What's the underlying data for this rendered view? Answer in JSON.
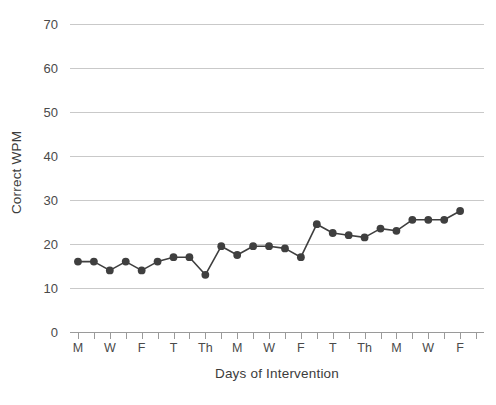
{
  "chart_data": {
    "type": "line",
    "title": "",
    "xlabel": "Days of Intervention",
    "ylabel": "Correct WPM",
    "ylim": [
      0,
      70
    ],
    "ytick_values": [
      0,
      10,
      20,
      30,
      40,
      50,
      60,
      70
    ],
    "ytick_labels": [
      "0",
      "10",
      "20",
      "30",
      "40",
      "50",
      "60",
      "70"
    ],
    "grid": "horizontal",
    "legend": "none",
    "marker": "filled-circle",
    "line_color": "#3f3f3f",
    "marker_color": "#3f3f3f",
    "gridline_color": "#c9c9c9",
    "axis_color": "#9a9a9a",
    "x_tick_count": 26,
    "xtick_labels": [
      "M",
      "",
      "W",
      "",
      "F",
      "",
      "T",
      "",
      "Th",
      "",
      "M",
      "",
      "W",
      "",
      "F",
      "",
      "T",
      "",
      "Th",
      "",
      "M",
      "",
      "W",
      "",
      "F",
      "",
      "T",
      "",
      "Th",
      ""
    ],
    "xtick_labels_visible": [
      "M",
      "W",
      "F",
      "T",
      "Th",
      "M",
      "W",
      "F",
      "T",
      "Th",
      "M",
      "W",
      "F",
      "T",
      "Th"
    ],
    "categories": [
      "M",
      "T",
      "W",
      "Th",
      "F",
      "M",
      "T",
      "W",
      "Th",
      "F",
      "M",
      "T",
      "W",
      "Th",
      "F",
      "M",
      "T",
      "W",
      "Th",
      "F",
      "M",
      "T",
      "W",
      "Th",
      "F"
    ],
    "x": [
      1,
      2,
      3,
      4,
      5,
      6,
      7,
      8,
      9,
      10,
      11,
      12,
      13,
      14,
      15,
      16,
      17,
      18,
      19,
      20,
      21,
      22,
      23,
      24,
      25
    ],
    "values": [
      16,
      16,
      14,
      16,
      14,
      16,
      17,
      17,
      13,
      19.5,
      17.5,
      19.5,
      19.5,
      19,
      17,
      24.5,
      22.5,
      22,
      21.5,
      23.5,
      23,
      25.5,
      25.5,
      25.5,
      27.5
    ],
    "series": [
      {
        "name": "Correct WPM",
        "values": [
          16,
          16,
          14,
          16,
          14,
          16,
          17,
          17,
          13,
          19.5,
          17.5,
          19.5,
          19.5,
          19,
          17,
          24.5,
          22.5,
          22,
          21.5,
          23.5,
          23,
          25.5,
          25.5,
          25.5,
          27.5
        ]
      }
    ]
  }
}
